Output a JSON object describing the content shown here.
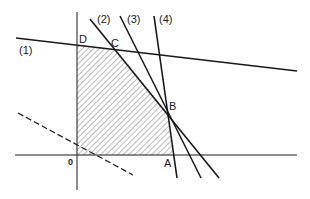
{
  "diagram": {
    "type": "linear-programming-feasible-region",
    "colors": {
      "ink": "#1a1a1a",
      "hatch": "#555555",
      "background": "#ffffff"
    },
    "axes": {
      "origin_label": "0"
    },
    "constraint_lines": [
      {
        "id": "1",
        "label": "(1)"
      },
      {
        "id": "2",
        "label": "(2)"
      },
      {
        "id": "3",
        "label": "(3)"
      },
      {
        "id": "4",
        "label": "(4)"
      }
    ],
    "vertices": [
      {
        "label": "D"
      },
      {
        "label": "C"
      },
      {
        "label": "B"
      },
      {
        "label": "A"
      },
      {
        "label": "0"
      }
    ],
    "region": {
      "style": "hatched",
      "vertices_order": [
        "0",
        "A",
        "B",
        "C",
        "D"
      ]
    },
    "objective_line": {
      "style": "dashed"
    }
  }
}
